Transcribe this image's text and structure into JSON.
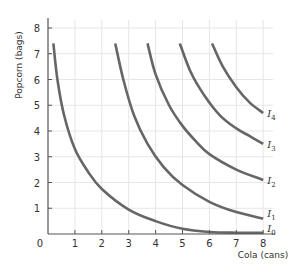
{
  "chart_data": {
    "type": "line",
    "title": "",
    "xlabel": "Cola (cans)",
    "ylabel": "Popcorn (bags)",
    "xlim": [
      0,
      8
    ],
    "ylim": [
      0,
      8
    ],
    "x_ticks": [
      "0",
      "1",
      "2",
      "3",
      "4",
      "5",
      "6",
      "7",
      "8"
    ],
    "y_ticks": [
      "1",
      "2",
      "3",
      "4",
      "5",
      "6",
      "7",
      "8"
    ],
    "grid": true,
    "legend": "inline labels at right end of curves",
    "series": [
      {
        "name": "I0",
        "label_base": "I",
        "label_sub": "0",
        "points": [
          [
            0.2,
            7.4
          ],
          [
            0.35,
            6.0
          ],
          [
            0.6,
            4.6
          ],
          [
            1.0,
            3.3
          ],
          [
            1.5,
            2.4
          ],
          [
            2.0,
            1.75
          ],
          [
            3.0,
            0.95
          ],
          [
            4.0,
            0.5
          ],
          [
            5.0,
            0.2
          ],
          [
            6.0,
            0.08
          ],
          [
            7.0,
            0.05
          ],
          [
            8.0,
            0.05
          ]
        ]
      },
      {
        "name": "I1",
        "label_base": "I",
        "label_sub": "1",
        "points": [
          [
            2.5,
            7.4
          ],
          [
            2.8,
            6.0
          ],
          [
            3.2,
            4.6
          ],
          [
            3.7,
            3.5
          ],
          [
            4.3,
            2.6
          ],
          [
            5.0,
            1.9
          ],
          [
            6.0,
            1.25
          ],
          [
            7.0,
            0.85
          ],
          [
            8.0,
            0.6
          ]
        ]
      },
      {
        "name": "I2",
        "label_base": "I",
        "label_sub": "2",
        "points": [
          [
            3.7,
            7.4
          ],
          [
            4.0,
            6.2
          ],
          [
            4.5,
            5.0
          ],
          [
            5.0,
            4.2
          ],
          [
            5.5,
            3.6
          ],
          [
            6.0,
            3.1
          ],
          [
            7.0,
            2.5
          ],
          [
            8.0,
            2.1
          ]
        ]
      },
      {
        "name": "I3",
        "label_base": "I",
        "label_sub": "3",
        "points": [
          [
            4.9,
            7.4
          ],
          [
            5.3,
            6.3
          ],
          [
            5.8,
            5.4
          ],
          [
            6.4,
            4.6
          ],
          [
            7.0,
            4.1
          ],
          [
            7.5,
            3.8
          ],
          [
            8.0,
            3.5
          ]
        ]
      },
      {
        "name": "I4",
        "label_base": "I",
        "label_sub": "4",
        "points": [
          [
            6.1,
            7.4
          ],
          [
            6.5,
            6.5
          ],
          [
            7.0,
            5.7
          ],
          [
            7.5,
            5.1
          ],
          [
            8.0,
            4.7
          ]
        ]
      }
    ],
    "colors": {
      "curve": "#666666",
      "axis": "#555555",
      "grid": "#e6e6e6",
      "text": "#333333"
    }
  }
}
